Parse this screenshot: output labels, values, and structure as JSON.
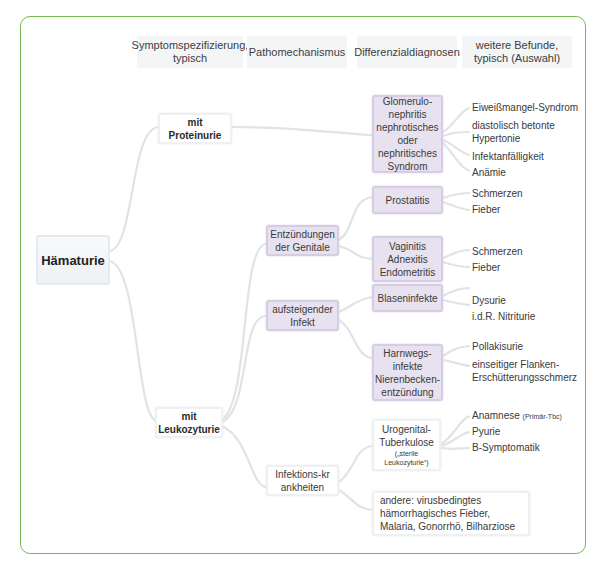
{
  "headers": [
    "Symptomspezifizierung, typisch",
    "Pathomechanismus",
    "Differenzialdiagnosen",
    "weitere Befunde, typisch (Auswahl)"
  ],
  "root": "Hämaturie",
  "level1": {
    "proteinurie": "mit Proteinurie",
    "leukozyturie": "mit Leukozyturie"
  },
  "level2": {
    "genitale": "Entzündungen der Genitale",
    "infekt": "aufsteigender Infekt",
    "infektionskrankheiten": "Infektions-krankheiten"
  },
  "diagnoses": {
    "glomerulonephritis": "Glomerulo-nephritis nephrotisches oder nephritisches Syndrom",
    "prostatitis": "Prostatitis",
    "vaginitis": "Vaginitis Adnexitis Endometritis",
    "blaseninfekte": "Blaseninfekte",
    "harnwegsinfekte": "Harnwegs-infekte Nierenbecken-entzündung",
    "tuberkulose": "Urogenital-Tuberkulose",
    "tuberkulose_note": "(„sterile Leukozyturie“)",
    "andere": "andere: virusbedingtes hämorrhagisches Fieber, Malaria, Gonorrhö, Bilharziose"
  },
  "findings": {
    "glomerulonephritis": [
      "Eiweißmangel-Syndrom",
      "diastolisch betonte Hypertonie",
      "Infektanfälligkeit",
      "Anämie"
    ],
    "prostatitis": [
      "Schmerzen",
      "Fieber"
    ],
    "vaginitis": [
      "Schmerzen",
      "Fieber"
    ],
    "blaseninfekte": [
      "Dysurie",
      "i.d.R. Nitriturie"
    ],
    "harnwegsinfekte": [
      "Pollakisurie",
      "einseitiger Flanken-Erschütterungsschmerz"
    ],
    "tuberkulose": [
      "Anamnese",
      "Pyurie",
      "B-Symptomatik"
    ],
    "tuberkulose_anamnese_note": "(Primär-Tbc)"
  },
  "colors": {
    "frame_border": "#78b850",
    "purple_node": "#e8e2f0",
    "connector": "#dfe2e6"
  }
}
